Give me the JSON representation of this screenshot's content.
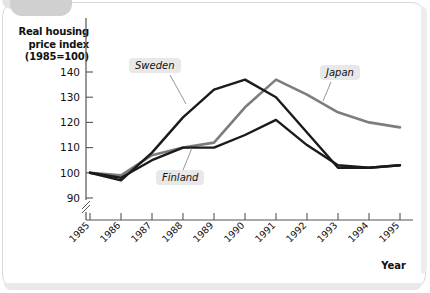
{
  "figure": {
    "y_axis_title_lines": [
      "Real housing",
      "price index",
      "(1985=100)"
    ],
    "x_axis_title": "Year"
  },
  "labels": {
    "sweden": "Sweden",
    "finland": "Finland",
    "japan": "Japan"
  },
  "colors": {
    "sweden": "#1a1a1a",
    "finland": "#1a1a1a",
    "japan": "#7d7d7d",
    "axis": "#555555",
    "chip_bg": "#e8e8e8",
    "page_bg": "#ffffff"
  },
  "chart_data": {
    "type": "line",
    "title": "Real housing price index (1985=100)",
    "xlabel": "Year",
    "ylabel": "Real housing price index (1985=100)",
    "x": [
      1985,
      1986,
      1987,
      1988,
      1989,
      1990,
      1991,
      1992,
      1993,
      1994,
      1995
    ],
    "categories": [
      "1985",
      "1986",
      "1987",
      "1988",
      "1989",
      "1990",
      "1991",
      "1992",
      "1993",
      "1994",
      "1995"
    ],
    "yticks": [
      90,
      100,
      110,
      120,
      130,
      140
    ],
    "ylim": [
      88,
      143
    ],
    "y_axis_break_below": 90,
    "grid": false,
    "legend": "inline-labels",
    "series": [
      {
        "name": "Sweden",
        "color": "#1a1a1a",
        "values": [
          100,
          97,
          108,
          122,
          133,
          137,
          130,
          116,
          102,
          102,
          103
        ]
      },
      {
        "name": "Finland",
        "color": "#1a1a1a",
        "values": [
          100,
          98,
          105,
          110,
          110,
          115,
          121,
          111,
          103,
          102,
          103
        ]
      },
      {
        "name": "Japan",
        "color": "#7d7d7d",
        "values": [
          100,
          99,
          107,
          110,
          112,
          126,
          137,
          131,
          124,
          120,
          118
        ]
      }
    ]
  }
}
